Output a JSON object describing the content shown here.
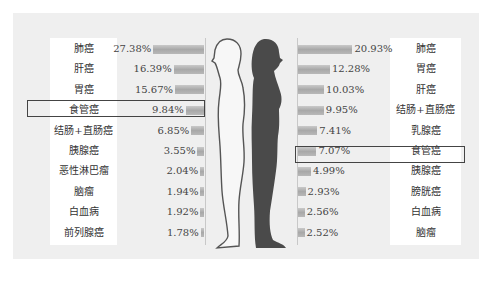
{
  "chart_data": [
    {
      "type": "bar",
      "orientation": "horizontal",
      "title": "",
      "series_name": "男性",
      "side": "left",
      "categories": [
        "肺癌",
        "肝癌",
        "胃癌",
        "食管癌",
        "结肠+直肠癌",
        "胰腺癌",
        "恶性淋巴瘤",
        "脑瘤",
        "白血病",
        "前列腺癌"
      ],
      "values": [
        27.38,
        16.39,
        15.67,
        9.84,
        6.85,
        3.55,
        2.04,
        1.94,
        1.92,
        1.78
      ],
      "value_labels": [
        "27.38%",
        "16.39%",
        "15.67%",
        "9.84%",
        "6.85%",
        "3.55%",
        "2.04%",
        "1.94%",
        "1.92%",
        "1.78%"
      ],
      "highlighted": "食管癌",
      "unit": "%"
    },
    {
      "type": "bar",
      "orientation": "horizontal",
      "title": "",
      "series_name": "女性",
      "side": "right",
      "categories": [
        "肺癌",
        "胃癌",
        "肝癌",
        "结肠+直肠癌",
        "乳腺癌",
        "食管癌",
        "胰腺癌",
        "膀胱癌",
        "白血病",
        "脑瘤"
      ],
      "values": [
        20.93,
        12.28,
        10.03,
        9.95,
        7.41,
        7.07,
        4.99,
        2.93,
        2.56,
        2.52
      ],
      "value_labels": [
        "20.93%",
        "12.28%",
        "10.03%",
        "9.95%",
        "7.41%",
        "7.07%",
        "4.99%",
        "2.93%",
        "2.56%",
        "2.52%"
      ],
      "highlighted": "食管癌",
      "unit": "%"
    }
  ],
  "male": {
    "rows": [
      {
        "label": "肺癌",
        "value": "27.38%",
        "num": 27.38
      },
      {
        "label": "肝癌",
        "value": "16.39%",
        "num": 16.39
      },
      {
        "label": "胃癌",
        "value": "15.67%",
        "num": 15.67
      },
      {
        "label": "食管癌",
        "value": "9.84%",
        "num": 9.84
      },
      {
        "label": "结肠+直肠癌",
        "value": "6.85%",
        "num": 6.85
      },
      {
        "label": "胰腺癌",
        "value": "3.55%",
        "num": 3.55
      },
      {
        "label": "恶性淋巴瘤",
        "value": "2.04%",
        "num": 2.04
      },
      {
        "label": "脑瘤",
        "value": "1.94%",
        "num": 1.94
      },
      {
        "label": "白血病",
        "value": "1.92%",
        "num": 1.92
      },
      {
        "label": "前列腺癌",
        "value": "1.78%",
        "num": 1.78
      }
    ],
    "highlight_index": 3
  },
  "female": {
    "rows": [
      {
        "label": "肺癌",
        "value": "20.93%",
        "num": 20.93
      },
      {
        "label": "胃癌",
        "value": "12.28%",
        "num": 12.28
      },
      {
        "label": "肝癌",
        "value": "10.03%",
        "num": 10.03
      },
      {
        "label": "结肠+直肠癌",
        "value": "9.95%",
        "num": 9.95
      },
      {
        "label": "乳腺癌",
        "value": "7.41%",
        "num": 7.41
      },
      {
        "label": "食管癌",
        "value": "7.07%",
        "num": 7.07
      },
      {
        "label": "胰腺癌",
        "value": "4.99%",
        "num": 4.99
      },
      {
        "label": "膀胱癌",
        "value": "2.93%",
        "num": 2.93
      },
      {
        "label": "白血病",
        "value": "2.56%",
        "num": 2.56
      },
      {
        "label": "脑瘤",
        "value": "2.52%",
        "num": 2.52
      }
    ],
    "highlight_index": 5
  },
  "colors": {
    "panel_bg": "#efefef",
    "bar": "#b4b4b4",
    "female_silhouette": "#4a4a4a",
    "male_outline": "#555555",
    "highlight_border": "#444444"
  }
}
